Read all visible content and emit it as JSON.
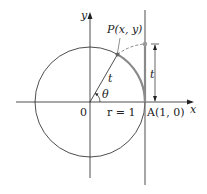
{
  "diagram": {
    "labels": {
      "y_axis": "y",
      "x_axis": "x",
      "point_p": "P(x, y)",
      "arc_length": "t",
      "vertical_t": "t",
      "angle": "θ",
      "origin": "0",
      "radius": "r = 1",
      "point_a": "A(1, 0)"
    },
    "colors": {
      "line": "#222222",
      "arc_highlight": "#8a8a8a",
      "tangent_line": "#777777"
    }
  }
}
